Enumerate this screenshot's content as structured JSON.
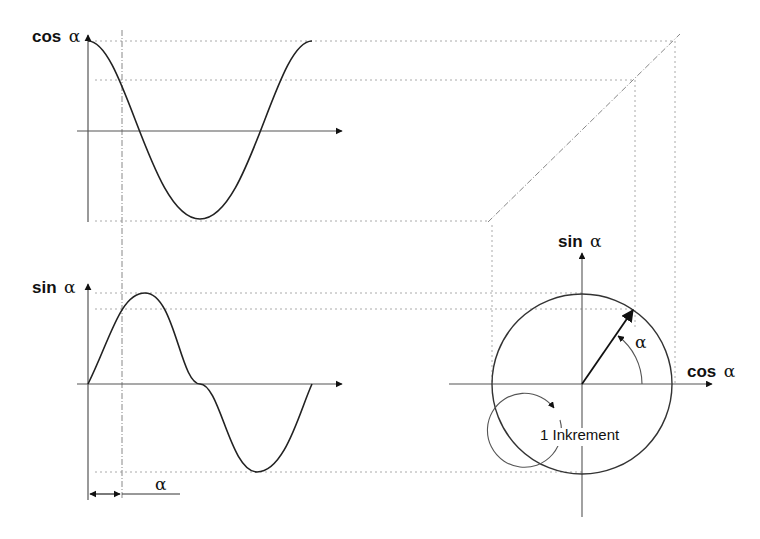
{
  "diagram": {
    "title": "",
    "cos_chart": {
      "y_label_bold": "cos",
      "y_label_symbol": "α",
      "curve": "cosine, one full period"
    },
    "sin_chart": {
      "y_label_bold": "sin",
      "y_label_symbol": "α",
      "curve": "sine, one full period",
      "angle_marker_label": "α"
    },
    "unit_circle": {
      "y_axis_label_bold": "sin",
      "y_axis_label_symbol": "α",
      "x_axis_label_bold": "cos",
      "x_axis_label_symbol": "α",
      "angle_label": "α",
      "increment_label": "1 Inkrement"
    },
    "colors": {
      "line": "#222222",
      "axis": "#444444",
      "guide": "#999999",
      "background": "#ffffff"
    }
  }
}
